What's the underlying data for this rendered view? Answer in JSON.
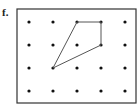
{
  "label": "f.",
  "grid": {
    "columns": 5,
    "rows": 4,
    "xs": [
      29,
      53,
      77,
      101,
      125
    ],
    "ys": [
      22,
      45,
      68,
      91
    ],
    "dot_color": "#111111",
    "dot_radius": 1.6
  },
  "frame": {
    "x": 17,
    "y": 9,
    "width": 119,
    "height": 94,
    "color": "#333333"
  },
  "polygon": {
    "shape": "quadrilateral",
    "vertices_grid": [
      [
        2,
        0
      ],
      [
        3,
        0
      ],
      [
        3,
        1
      ],
      [
        1,
        2
      ]
    ],
    "stroke": "#555555"
  }
}
